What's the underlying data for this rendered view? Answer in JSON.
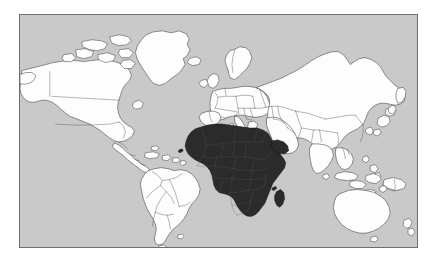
{
  "figure": {
    "type": "world-map",
    "projection": "equirectangular",
    "width": 436,
    "height": 263,
    "background_color": "#ffffff"
  },
  "map": {
    "frame": {
      "x": 19,
      "y": 14,
      "width": 399,
      "height": 234,
      "border_color": "#6e6e6e",
      "border_width": 1
    },
    "ocean_color": "#c9c9c9",
    "land_color": "#fdfdfd",
    "land_outline_color": "#3b3b3b",
    "country_border_color": "#585858",
    "highlight_color": "#2b2b2b",
    "highlight_outline_color": "#141414"
  },
  "legend": {
    "visible": false,
    "entries": [
      {
        "label": "Africa (highlighted region)",
        "color": "#2b2b2b"
      },
      {
        "label": "Rest of world",
        "color": "#fdfdfd"
      },
      {
        "label": "Ocean",
        "color": "#c9c9c9"
      }
    ]
  },
  "highlighted_region": {
    "name": "Africa",
    "color": "#2b2b2b",
    "includes_islands": [
      "Madagascar",
      "Cape Verde",
      "Comoros"
    ]
  },
  "continents": [
    {
      "name": "North America",
      "highlighted": false
    },
    {
      "name": "South America",
      "highlighted": false
    },
    {
      "name": "Europe",
      "highlighted": false
    },
    {
      "name": "Africa",
      "highlighted": true
    },
    {
      "name": "Asia",
      "highlighted": false
    },
    {
      "name": "Oceania",
      "highlighted": false
    },
    {
      "name": "Greenland",
      "highlighted": false
    }
  ],
  "labels": {
    "title": "",
    "caption": "",
    "axis_visible": false,
    "gridlines_visible": false
  }
}
